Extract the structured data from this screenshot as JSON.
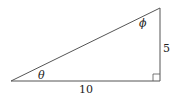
{
  "diagram": {
    "type": "right-triangle",
    "vertices": {
      "left": [
        11,
        81
      ],
      "right_angle": [
        160,
        81
      ],
      "top": [
        160,
        8
      ]
    },
    "labels": {
      "base": "10",
      "height": "5",
      "angle_left": "θ",
      "angle_top": "ϕ"
    },
    "colors": {
      "stroke": "#555555",
      "text": "#222222"
    }
  }
}
